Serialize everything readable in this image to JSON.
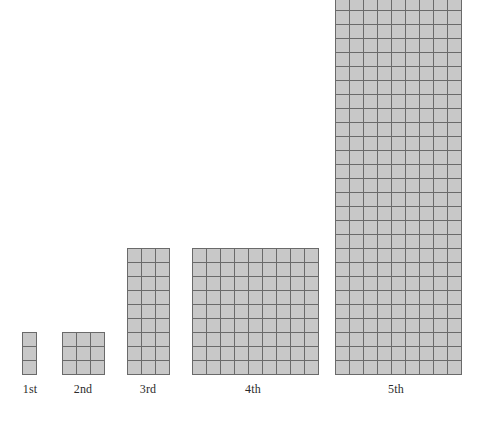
{
  "chart_data": {
    "type": "bar",
    "title": "",
    "subtitle": "",
    "xlabel": "",
    "ylabel": "",
    "categories": [
      "1st",
      "2nd",
      "3rd",
      "4th",
      "5th"
    ],
    "values": [
      3,
      9,
      27,
      81,
      243
    ],
    "annotations": [],
    "legend": [],
    "grid": true,
    "figures": [
      {
        "label": "1st",
        "columns": 1,
        "rows": 3,
        "cells": 3
      },
      {
        "label": "2nd",
        "columns": 3,
        "rows": 3,
        "cells": 9
      },
      {
        "label": "3rd",
        "columns": 3,
        "rows": 9,
        "cells": 27
      },
      {
        "label": "4th",
        "columns": 9,
        "rows": 9,
        "cells": 81
      },
      {
        "label": "5th",
        "columns": 9,
        "rows": 27,
        "cells": 243
      }
    ],
    "colors": {
      "cell_fill": "#c8c8c8",
      "cell_border": "#6a6a6a",
      "background": "#ffffff",
      "label_text": "#2b2b2b"
    }
  }
}
